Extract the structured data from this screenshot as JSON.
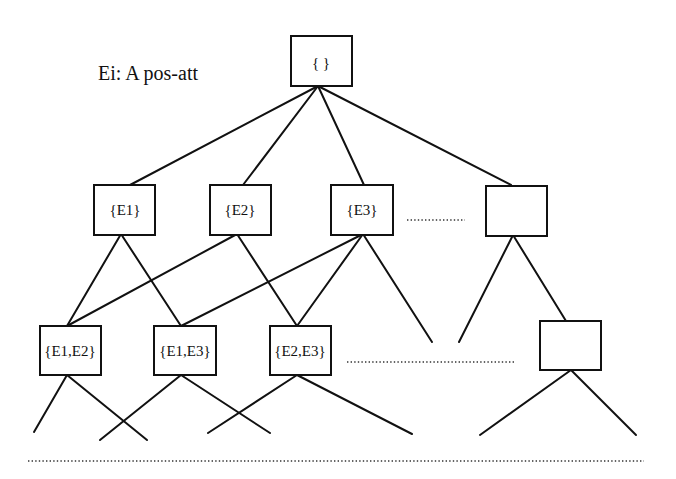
{
  "legend": {
    "text": "Ei:  A pos-att"
  },
  "nodes": {
    "root": "{ }",
    "e1": "{E1}",
    "e2": "{E2}",
    "e3": "{E3}",
    "level1_more": "",
    "e1e2": "{E1,E2}",
    "e1e3": "{E1,E3}",
    "e2e3": "{E2,E3}",
    "level2_more": ""
  },
  "structure": {
    "type": "lattice",
    "levels": [
      [
        "{ }"
      ],
      [
        "{E1}",
        "{E2}",
        "{E3}",
        "...",
        "(empty box)"
      ],
      [
        "{E1,E2}",
        "{E1,E3}",
        "{E2,E3}",
        "...",
        "(empty box)"
      ]
    ],
    "edges": [
      [
        "{ }",
        "{E1}"
      ],
      [
        "{ }",
        "{E2}"
      ],
      [
        "{ }",
        "{E3}"
      ],
      [
        "{ }",
        "(empty box L1)"
      ],
      [
        "{E1}",
        "{E1,E2}"
      ],
      [
        "{E1}",
        "{E1,E3}"
      ],
      [
        "{E2}",
        "{E1,E2}"
      ],
      [
        "{E2}",
        "{E2,E3}"
      ],
      [
        "{E3}",
        "{E1,E3}"
      ],
      [
        "{E3}",
        "{E2,E3}"
      ]
    ]
  }
}
